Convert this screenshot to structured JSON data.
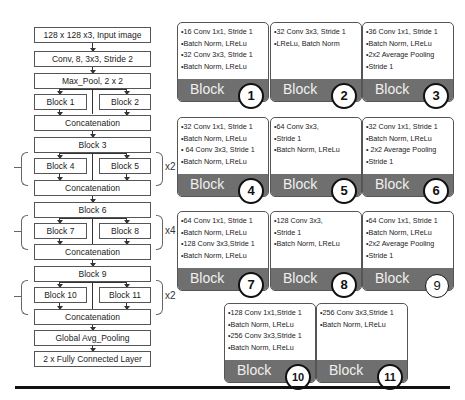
{
  "flowchart": {
    "input": "128 x 128 x3, Input image",
    "conv": "Conv, 8, 3x3, Stride 2",
    "maxpool": "Max_Pool, 2 x 2",
    "block1": "Block 1",
    "block2": "Block 2",
    "concat1": "Concatenation",
    "block3": "Block 3",
    "block4": "Block 4",
    "block5": "Block 5",
    "concat2": "Concatenation",
    "block6": "Block 6",
    "block7": "Block 7",
    "block8": "Block 8",
    "concat3": "Concatenation",
    "block9": "Block 9",
    "block10": "Block 10",
    "block11": "Block 11",
    "concat4": "Concatenation",
    "gap": "Global Avg_Pooling",
    "fc": "2 x Fully Connected Layer",
    "repeat_a": "x2",
    "repeat_b": "x4",
    "repeat_c": "x2"
  },
  "blocks": [
    {
      "number": "1",
      "label": "Block",
      "lines": [
        "•16 Conv 1x1, Stride 1",
        "•Batch Norm, LReLu",
        "•32 Conv 3x3, Stride 1",
        "•Batch Norm, LReLu"
      ]
    },
    {
      "number": "2",
      "label": "Block",
      "lines": [
        "•32 Conv 3x3, Stride 1",
        "•LReLu, Batch Norm"
      ]
    },
    {
      "number": "3",
      "label": "Block",
      "lines": [
        "•36 Conv 1x1, Stride 1",
        "•Batch Norm, LReLu",
        "•2x2 Average Pooling",
        "•Stride 1"
      ]
    },
    {
      "number": "4",
      "label": "Block",
      "lines": [
        "•32 Conv 1x1, Stride 1",
        "•Batch Norm, LReLu",
        "• 64 Conv 3x3, Stride 1",
        "•Batch Norm, LReLu"
      ]
    },
    {
      "number": "5",
      "label": "Block",
      "lines": [
        "•64 Conv 3x3,",
        "•Stride 1",
        "•Batch Norm, LReLu"
      ]
    },
    {
      "number": "6",
      "label": "Block",
      "lines": [
        "•32 Conv 1x1, Stride 1",
        "•Batch Norm, LReLu",
        "• 2x2 Average Pooling",
        "•Stride 1"
      ]
    },
    {
      "number": "7",
      "label": "Block",
      "lines": [
        "•64 Conv 1x1, Stride 1",
        "•Batch Norm, LReLu",
        "•128 Conv 3x3,Stride 1",
        "•Batch Norm, LReLu"
      ]
    },
    {
      "number": "8",
      "label": "Block",
      "lines": [
        "•128 Conv 3x3,",
        "•Stride 1",
        "•Batch Norm, LReLu"
      ]
    },
    {
      "number": "9",
      "label": "Block",
      "lines": [
        "•64 Conv 1x1, Stride 1",
        "•Batch Norm, LReLu",
        "•2x2 Average Pooling",
        "•Stride 1"
      ]
    },
    {
      "number": "10",
      "label": "Block",
      "lines": [
        "•128 Conv 1x1,Stride 1",
        "•Batch Norm, LReLu",
        "•256 Conv 3x3,Stride 1",
        "•Batch Norm, LReLu"
      ]
    },
    {
      "number": "11",
      "label": "Block",
      "lines": [
        "•256 Conv 3x3,Stride 1",
        "•Batch Norm, LReLu"
      ]
    }
  ],
  "colors": {
    "block_bar": "#6f6f6f",
    "border": "#555555",
    "rule": "#111111"
  }
}
